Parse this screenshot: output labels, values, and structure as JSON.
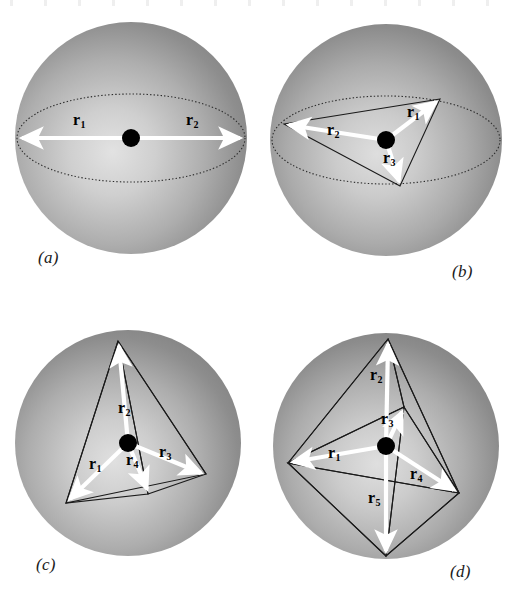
{
  "figure": {
    "background_color": "#ffffff",
    "sphere_color_dark": "#808080",
    "sphere_color_light": "#d8d8d8",
    "vector_color": "#ffffff",
    "edge_color": "#1a1a1a",
    "center_dot_color": "#000000"
  },
  "panels": [
    {
      "letter": "(a)",
      "name": "panel-a",
      "geometry": "linear",
      "equator_visible": true,
      "center": {
        "x": 131,
        "y": 138
      },
      "radius": 116,
      "vector_count": 2,
      "vectors": [
        {
          "id": "r1",
          "label": "r",
          "sub": "1",
          "tip": {
            "x": 17,
            "y": 138
          },
          "label_pos": {
            "x": 73,
            "y": 122
          }
        },
        {
          "id": "r2",
          "label": "r",
          "sub": "2",
          "tip": {
            "x": 245,
            "y": 138
          },
          "label_pos": {
            "x": 186,
            "y": 122
          }
        }
      ],
      "label_pos": {
        "x": 38,
        "y": 248
      }
    },
    {
      "letter": "(b)",
      "name": "panel-b",
      "geometry": "triangle",
      "equator_visible": true,
      "center": {
        "x": 386,
        "y": 140
      },
      "radius": 116,
      "vector_count": 3,
      "vectors": [
        {
          "id": "r1",
          "label": "r",
          "sub": "1",
          "tip": {
            "x": 440,
            "y": 99
          },
          "label_pos": {
            "x": 407,
            "y": 110
          }
        },
        {
          "id": "r2",
          "label": "r",
          "sub": "2",
          "tip": {
            "x": 284,
            "y": 124
          },
          "label_pos": {
            "x": 328,
            "y": 128
          }
        },
        {
          "id": "r3",
          "label": "r",
          "sub": "3",
          "tip": {
            "x": 400,
            "y": 186
          },
          "label_pos": {
            "x": 385,
            "y": 156
          }
        }
      ],
      "label_pos": {
        "x": 452,
        "y": 262
      }
    },
    {
      "letter": "(c)",
      "name": "panel-c",
      "geometry": "tetrahedron",
      "equator_visible": false,
      "center": {
        "x": 128,
        "y": 443
      },
      "radius": 113,
      "vector_count": 4,
      "vectors": [
        {
          "id": "r1",
          "label": "r",
          "sub": "1",
          "tip": {
            "x": 66,
            "y": 503
          },
          "label_pos": {
            "x": 92,
            "y": 462
          }
        },
        {
          "id": "r2",
          "label": "r",
          "sub": "2",
          "tip": {
            "x": 118,
            "y": 341
          },
          "label_pos": {
            "x": 120,
            "y": 408
          }
        },
        {
          "id": "r3",
          "label": "r",
          "sub": "3",
          "tip": {
            "x": 206,
            "y": 474
          },
          "label_pos": {
            "x": 161,
            "y": 450
          }
        },
        {
          "id": "r4",
          "label": "r",
          "sub": "4",
          "tip": {
            "x": 148,
            "y": 494
          },
          "label_pos": {
            "x": 127,
            "y": 457
          }
        }
      ],
      "label_pos": {
        "x": 36,
        "y": 555
      }
    },
    {
      "letter": "(d)",
      "name": "panel-d",
      "geometry": "trigonal-bipyramid",
      "equator_visible": false,
      "center": {
        "x": 386,
        "y": 446
      },
      "radius": 113,
      "vector_count": 5,
      "vectors": [
        {
          "id": "r1",
          "label": "r",
          "sub": "1",
          "tip": {
            "x": 288,
            "y": 463
          },
          "label_pos": {
            "x": 330,
            "y": 451
          }
        },
        {
          "id": "r2",
          "label": "r",
          "sub": "2",
          "tip": {
            "x": 388,
            "y": 339
          },
          "label_pos": {
            "x": 372,
            "y": 375
          }
        },
        {
          "id": "r3",
          "label": "r",
          "sub": "3",
          "tip": {
            "x": 404,
            "y": 407
          },
          "label_pos": {
            "x": 382,
            "y": 418
          }
        },
        {
          "id": "r4",
          "label": "r",
          "sub": "4",
          "tip": {
            "x": 459,
            "y": 493
          },
          "label_pos": {
            "x": 412,
            "y": 473
          }
        },
        {
          "id": "r5",
          "label": "r",
          "sub": "5",
          "tip": {
            "x": 386,
            "y": 556
          },
          "label_pos": {
            "x": 370,
            "y": 497
          }
        }
      ],
      "label_pos": {
        "x": 450,
        "y": 562
      }
    }
  ]
}
